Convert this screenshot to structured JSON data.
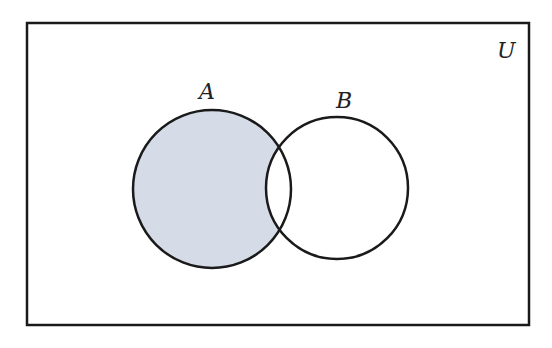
{
  "diagram": {
    "type": "venn",
    "universe_label": "U",
    "sets": [
      {
        "label": "A",
        "cx": 212,
        "cy": 189,
        "r": 79
      },
      {
        "label": "B",
        "cx": 337,
        "cy": 188,
        "r": 71
      }
    ],
    "shaded_region": "A minus B",
    "colors": {
      "shade": "#d5dbe7",
      "stroke": "#1a1a1a",
      "background": "#ffffff"
    }
  }
}
